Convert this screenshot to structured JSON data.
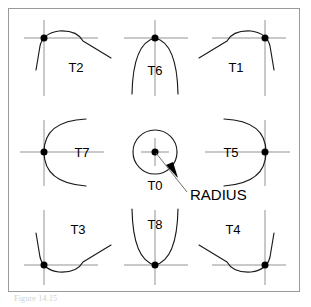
{
  "figure": {
    "caption": "Figure 14.15",
    "frame": {
      "x": 8,
      "y": 8,
      "width": 292,
      "height": 284,
      "border_color": "#9a9a9a",
      "background": "#ffffff"
    }
  },
  "colors": {
    "curve": "#1a1a1a",
    "crosshair": "#c9c9c9",
    "dot": "#000000",
    "label_text": "#000000",
    "leader": "#707070",
    "frame_border": "#9a9a9a",
    "caption_text": "#cfcfcf",
    "background": "#ffffff"
  },
  "annotation": {
    "radius_label": "RADIUS",
    "radius_label_x": 188,
    "radius_label_y": 196,
    "leader_from_x": 155,
    "leader_from_y": 152,
    "leader_elbow_x": 185,
    "leader_elbow_y": 194,
    "arrow_tip_x": 168,
    "arrow_tip_y": 168
  },
  "center_tool": {
    "id": "T0",
    "label": "T0",
    "description": "circle with center point",
    "cx": 155,
    "cy": 152,
    "r": 22,
    "label_x": 155,
    "label_y": 186,
    "dot_x": 155,
    "dot_y": 152,
    "crosshair_len": 14
  },
  "tools": [
    {
      "id": "T2",
      "label": "T2",
      "position": "top-left",
      "corner": "upper-left",
      "dot_x": 44,
      "dot_y": 38,
      "label_x": 76,
      "label_y": 71,
      "crosshair_h_len": 40,
      "crosshair_v_len": 40
    },
    {
      "id": "T6",
      "label": "T6",
      "position": "top-center",
      "corner": "top",
      "dot_x": 155,
      "dot_y": 38,
      "label_x": 155,
      "label_y": 74,
      "crosshair_h_len": 34,
      "crosshair_v_len": 34
    },
    {
      "id": "T1",
      "label": "T1",
      "position": "top-right",
      "corner": "upper-right",
      "dot_x": 265,
      "dot_y": 38,
      "label_x": 235,
      "label_y": 71,
      "crosshair_h_len": 40,
      "crosshair_v_len": 40
    },
    {
      "id": "T7",
      "label": "T7",
      "position": "middle-left",
      "corner": "left",
      "dot_x": 44,
      "dot_y": 152,
      "label_x": 80,
      "label_y": 157,
      "crosshair_h_len": 34,
      "crosshair_v_len": 34
    },
    {
      "id": "T5",
      "label": "T5",
      "position": "middle-right",
      "corner": "right",
      "dot_x": 265,
      "dot_y": 152,
      "label_x": 231,
      "label_y": 157,
      "crosshair_h_len": 34,
      "crosshair_v_len": 34
    },
    {
      "id": "T3",
      "label": "T3",
      "position": "bottom-left",
      "corner": "lower-left",
      "dot_x": 44,
      "dot_y": 265,
      "label_x": 77,
      "label_y": 233,
      "crosshair_h_len": 40,
      "crosshair_v_len": 40
    },
    {
      "id": "T8",
      "label": "T8",
      "position": "bottom-center",
      "corner": "bottom",
      "dot_x": 155,
      "dot_y": 265,
      "label_x": 155,
      "label_y": 228,
      "crosshair_h_len": 34,
      "crosshair_v_len": 34
    },
    {
      "id": "T4",
      "label": "T4",
      "position": "bottom-right",
      "corner": "lower-right",
      "dot_x": 265,
      "dot_y": 265,
      "label_x": 232,
      "label_y": 233,
      "crosshair_h_len": 40,
      "crosshair_v_len": 40
    }
  ],
  "geometry": {
    "dot_radius": 3.4,
    "curve_stroke_width": 1.1,
    "crosshair_stroke_width": 1.1,
    "circle_stroke_width": 1.1,
    "label_font_size": 13
  },
  "paths": {
    "T2": "M 36 67 L 41 45 Q 44 33 60 31 Q 78 30 84 40 L 110 57",
    "T6": "M 133 93 Q 134 42 155 38 Q 176 42 177 93",
    "T1": "M 274 67 L 269 45 Q 266 33 250 31 Q 232 30 226 40 L 200 57",
    "T7": "M 85 118 Q 44 120 44 152 Q 44 184 85 187",
    "T5": "M 225 118 Q 265 120 265 152 Q 265 184 225 187",
    "T3": "M 36 236 L 41 258 Q 44 270 60 272 Q 78 273 84 263 L 110 246",
    "T8": "M 133 210 Q 134 261 155 265 Q 176 261 177 210",
    "T4": "M 274 236 L 269 258 Q 266 270 250 272 Q 232 273 226 263 L 200 246"
  }
}
